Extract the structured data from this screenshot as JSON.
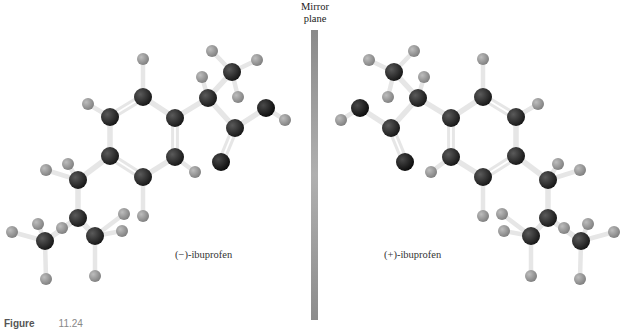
{
  "figure": {
    "mirror_label_line1": "Mirror",
    "mirror_label_line2": "plane",
    "left_label": "(−)-ibuprofen",
    "right_label": "(+)-ibuprofen",
    "caption_prefix": "Figure",
    "caption_number": "11.24"
  },
  "colors": {
    "carbon": "#2a2a2a",
    "oxygen": "#1a1a1a",
    "hydrogen": "#9a9a9a",
    "bond": "#e6e6e6",
    "mirror": "#9a9a9a"
  },
  "molecules": {
    "left": {
      "atoms": [
        {
          "id": "C1",
          "t": "C",
          "x": 143,
          "y": 97
        },
        {
          "id": "C2",
          "t": "C",
          "x": 110,
          "y": 117
        },
        {
          "id": "C3",
          "t": "C",
          "x": 110,
          "y": 156
        },
        {
          "id": "C4",
          "t": "C",
          "x": 143,
          "y": 177
        },
        {
          "id": "C5",
          "t": "C",
          "x": 175,
          "y": 157
        },
        {
          "id": "C6",
          "t": "C",
          "x": 175,
          "y": 118
        },
        {
          "id": "Ca",
          "t": "C",
          "x": 208,
          "y": 98
        },
        {
          "id": "Cme",
          "t": "C",
          "x": 232,
          "y": 72
        },
        {
          "id": "Cc",
          "t": "C",
          "x": 235,
          "y": 128
        },
        {
          "id": "Od",
          "t": "O",
          "x": 221,
          "y": 162
        },
        {
          "id": "Oh",
          "t": "O",
          "x": 266,
          "y": 108
        },
        {
          "id": "Cb1",
          "t": "C",
          "x": 78,
          "y": 180
        },
        {
          "id": "Cb2",
          "t": "C",
          "x": 78,
          "y": 218
        },
        {
          "id": "Cb3",
          "t": "C",
          "x": 45,
          "y": 241
        },
        {
          "id": "Cb4",
          "t": "C",
          "x": 95,
          "y": 236
        },
        {
          "id": "H1",
          "t": "H",
          "x": 143,
          "y": 59
        },
        {
          "id": "H2",
          "t": "H",
          "x": 88,
          "y": 104
        },
        {
          "id": "H5",
          "t": "H",
          "x": 195,
          "y": 172
        },
        {
          "id": "H4",
          "t": "H",
          "x": 143,
          "y": 216
        },
        {
          "id": "Ha",
          "t": "H",
          "x": 202,
          "y": 77
        },
        {
          "id": "Hme1",
          "t": "H",
          "x": 212,
          "y": 51
        },
        {
          "id": "Hme2",
          "t": "H",
          "x": 257,
          "y": 60
        },
        {
          "id": "Hme3",
          "t": "H",
          "x": 238,
          "y": 97
        },
        {
          "id": "Hoh",
          "t": "H",
          "x": 285,
          "y": 120
        },
        {
          "id": "Hb1a",
          "t": "H",
          "x": 46,
          "y": 170
        },
        {
          "id": "Hb1b",
          "t": "H",
          "x": 68,
          "y": 164
        },
        {
          "id": "Hb2",
          "t": "H",
          "x": 62,
          "y": 228
        },
        {
          "id": "Hb3a",
          "t": "H",
          "x": 12,
          "y": 232
        },
        {
          "id": "Hb3b",
          "t": "H",
          "x": 38,
          "y": 224
        },
        {
          "id": "Hb3c",
          "t": "H",
          "x": 46,
          "y": 279
        },
        {
          "id": "Hb4a",
          "t": "H",
          "x": 124,
          "y": 214
        },
        {
          "id": "Hb4b",
          "t": "H",
          "x": 122,
          "y": 231
        },
        {
          "id": "Hb4c",
          "t": "H",
          "x": 95,
          "y": 276
        }
      ],
      "bonds": [
        [
          "C1",
          "C2",
          2
        ],
        [
          "C2",
          "C3",
          1
        ],
        [
          "C3",
          "C4",
          2
        ],
        [
          "C4",
          "C5",
          1
        ],
        [
          "C5",
          "C6",
          2
        ],
        [
          "C6",
          "C1",
          1
        ],
        [
          "C6",
          "Ca",
          1
        ],
        [
          "Ca",
          "Cme",
          1
        ],
        [
          "Ca",
          "Cc",
          1
        ],
        [
          "Cc",
          "Od",
          2
        ],
        [
          "Cc",
          "Oh",
          1
        ],
        [
          "C3",
          "Cb1",
          1
        ],
        [
          "Cb1",
          "Cb2",
          1
        ],
        [
          "Cb2",
          "Cb3",
          1
        ],
        [
          "Cb2",
          "Cb4",
          1
        ],
        [
          "C1",
          "H1",
          1
        ],
        [
          "C2",
          "H2",
          1
        ],
        [
          "C5",
          "H5",
          1
        ],
        [
          "C4",
          "H4",
          1
        ],
        [
          "Ca",
          "Ha",
          1
        ],
        [
          "Cme",
          "Hme1",
          1
        ],
        [
          "Cme",
          "Hme2",
          1
        ],
        [
          "Cme",
          "Hme3",
          1
        ],
        [
          "Oh",
          "Hoh",
          1
        ],
        [
          "Cb1",
          "Hb1a",
          1
        ],
        [
          "Cb1",
          "Hb1b",
          1
        ],
        [
          "Cb2",
          "Hb2",
          1
        ],
        [
          "Cb3",
          "Hb3a",
          1
        ],
        [
          "Cb3",
          "Hb3b",
          1
        ],
        [
          "Cb3",
          "Hb3c",
          1
        ],
        [
          "Cb4",
          "Hb4a",
          1
        ],
        [
          "Cb4",
          "Hb4b",
          1
        ],
        [
          "Cb4",
          "Hb4c",
          1
        ]
      ]
    },
    "right_mirror_axis_x": 626
  }
}
